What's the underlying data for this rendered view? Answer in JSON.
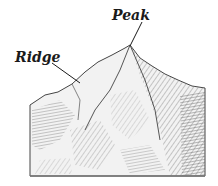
{
  "diagram": {
    "labels": {
      "peak": "Peak",
      "ridge": "Ridge"
    },
    "colors": {
      "ink": "#1a1a1a",
      "shade_dark": "#555555",
      "shade_mid": "#8a8a8a",
      "shade_light": "#c4c4c4",
      "background": "#ffffff"
    }
  }
}
